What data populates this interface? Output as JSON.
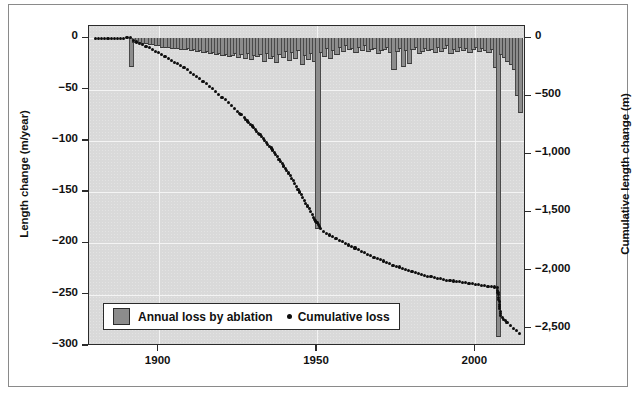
{
  "chart_data": {
    "type": "bar",
    "title": "",
    "subtitle": "",
    "xlabel": "",
    "ylabel": "Length change (m/year)",
    "y2label": "Cumulative length change (m)",
    "xlim": [
      1878,
      2016
    ],
    "ylim": [
      -300,
      12
    ],
    "y2lim": [
      -2650,
      106
    ],
    "grid": true,
    "legend_position": "bottom-left",
    "x_ticks": [
      "1900",
      "1950",
      "2000"
    ],
    "x_tick_values": [
      1900,
      1950,
      2000
    ],
    "y_ticks": [
      "0",
      "−50",
      "−100",
      "−150",
      "−200",
      "−250",
      "−300"
    ],
    "y_tick_values": [
      0,
      -50,
      -100,
      -150,
      -200,
      -250,
      -300
    ],
    "y2_ticks": [
      "0",
      "−500",
      "−1,000",
      "−1,500",
      "−2,000",
      "−2,500"
    ],
    "y2_tick_values": [
      0,
      -500,
      -1000,
      -1500,
      -2000,
      -2500
    ],
    "series": [
      {
        "name": "Annual loss by ablation",
        "type": "bar",
        "axis": "left",
        "color": "#8c8c8c",
        "x": [
          1891,
          1892,
          1893,
          1894,
          1895,
          1896,
          1897,
          1898,
          1899,
          1900,
          1901,
          1902,
          1903,
          1904,
          1905,
          1906,
          1907,
          1908,
          1909,
          1910,
          1911,
          1912,
          1913,
          1914,
          1915,
          1916,
          1917,
          1918,
          1919,
          1920,
          1921,
          1922,
          1923,
          1924,
          1925,
          1926,
          1927,
          1928,
          1929,
          1930,
          1931,
          1932,
          1933,
          1934,
          1935,
          1936,
          1937,
          1938,
          1939,
          1940,
          1941,
          1942,
          1943,
          1944,
          1945,
          1946,
          1947,
          1948,
          1949,
          1950,
          1951,
          1952,
          1953,
          1954,
          1955,
          1956,
          1957,
          1958,
          1959,
          1960,
          1961,
          1962,
          1963,
          1964,
          1965,
          1966,
          1967,
          1968,
          1969,
          1970,
          1971,
          1972,
          1973,
          1974,
          1975,
          1976,
          1977,
          1978,
          1979,
          1980,
          1981,
          1982,
          1983,
          1984,
          1985,
          1986,
          1987,
          1988,
          1989,
          1990,
          1991,
          1992,
          1993,
          1994,
          1995,
          1996,
          1997,
          1998,
          1999,
          2000,
          2001,
          2002,
          2003,
          2004,
          2005,
          2006,
          2007,
          2008,
          2009,
          2010,
          2011,
          2012,
          2013,
          2014
        ],
        "values": [
          -27,
          -4,
          -4,
          -4,
          -5,
          -5,
          -6,
          -6,
          -7,
          -7,
          -8,
          -8,
          -8,
          -9,
          -9,
          -9,
          -10,
          -10,
          -9,
          -11,
          -10,
          -12,
          -11,
          -13,
          -12,
          -14,
          -13,
          -15,
          -14,
          -16,
          -15,
          -17,
          -16,
          -14,
          -18,
          -15,
          -19,
          -14,
          -20,
          -16,
          -17,
          -15,
          -22,
          -14,
          -19,
          -17,
          -23,
          -15,
          -18,
          -12,
          -21,
          -13,
          -19,
          -11,
          -25,
          -16,
          -20,
          -14,
          -22,
          -185,
          -13,
          -17,
          -9,
          -19,
          -11,
          -15,
          -8,
          -12,
          -7,
          -10,
          -9,
          -13,
          -8,
          -11,
          -7,
          -12,
          -10,
          -9,
          -14,
          -11,
          -10,
          -8,
          -13,
          -30,
          -12,
          -9,
          -27,
          -11,
          -24,
          -10,
          -8,
          -14,
          -12,
          -9,
          -11,
          -10,
          -13,
          -8,
          -12,
          -9,
          -7,
          -14,
          -10,
          -12,
          -8,
          -11,
          -9,
          -13,
          -10,
          -8,
          -12,
          -9,
          -11,
          -13,
          -10,
          -28,
          -290,
          -15,
          -18,
          -22,
          -25,
          -30,
          -55,
          -72
        ]
      },
      {
        "name": "Cumulative loss",
        "type": "scatter",
        "axis": "right",
        "color": "#0d0d0d",
        "x": [
          1880,
          1881,
          1882,
          1884,
          1885,
          1886,
          1888,
          1889,
          1890,
          1891,
          1892,
          1893,
          1894,
          1895,
          1896,
          1897,
          1898,
          1899,
          1900,
          1901,
          1902,
          1903,
          1904,
          1905,
          1906,
          1907,
          1908,
          1909,
          1910,
          1911,
          1912,
          1913,
          1914,
          1915,
          1916,
          1917,
          1918,
          1919,
          1920,
          1921,
          1922,
          1923,
          1924,
          1925,
          1926,
          1927,
          1928,
          1929,
          1930,
          1931,
          1932,
          1933,
          1934,
          1935,
          1936,
          1937,
          1938,
          1939,
          1940,
          1941,
          1942,
          1943,
          1944,
          1945,
          1946,
          1947,
          1948,
          1949,
          1950,
          1951,
          1952,
          1953,
          1954,
          1955,
          1956,
          1957,
          1958,
          1959,
          1960,
          1961,
          1962,
          1963,
          1964,
          1965,
          1966,
          1967,
          1968,
          1969,
          1970,
          1971,
          1972,
          1973,
          1974,
          1975,
          1976,
          1977,
          1978,
          1979,
          1980,
          1981,
          1982,
          1983,
          1984,
          1985,
          1986,
          1987,
          1988,
          1989,
          1990,
          1991,
          1992,
          1993,
          1994,
          1995,
          1996,
          1997,
          1998,
          1999,
          2000,
          2001,
          2002,
          2003,
          2004,
          2005,
          2006,
          2007,
          2008,
          2009,
          2010,
          2011,
          2012,
          2013,
          2014
        ],
        "values": [
          0,
          0,
          0,
          0,
          0,
          0,
          0,
          0,
          5,
          5,
          -20,
          -32,
          -44,
          -56,
          -68,
          -80,
          -95,
          -110,
          -124,
          -140,
          -155,
          -170,
          -188,
          -205,
          -220,
          -238,
          -255,
          -272,
          -292,
          -310,
          -330,
          -350,
          -372,
          -392,
          -414,
          -436,
          -458,
          -482,
          -506,
          -530,
          -556,
          -580,
          -604,
          -630,
          -658,
          -684,
          -712,
          -740,
          -770,
          -800,
          -832,
          -862,
          -894,
          -928,
          -962,
          -1000,
          -1040,
          -1080,
          -1120,
          -1160,
          -1205,
          -1252,
          -1300,
          -1348,
          -1396,
          -1444,
          -1492,
          -1540,
          -1590,
          -1640,
          -1660,
          -1678,
          -1694,
          -1710,
          -1724,
          -1738,
          -1752,
          -1766,
          -1780,
          -1794,
          -1806,
          -1820,
          -1834,
          -1848,
          -1860,
          -1872,
          -1884,
          -1896,
          -1908,
          -1918,
          -1930,
          -1942,
          -1954,
          -1962,
          -1970,
          -1980,
          -1990,
          -2000,
          -2008,
          -2016,
          -2024,
          -2032,
          -2040,
          -2048,
          -2054,
          -2060,
          -2066,
          -2072,
          -2078,
          -2082,
          -2086,
          -2090,
          -2094,
          -2098,
          -2102,
          -2106,
          -2110,
          -2114,
          -2118,
          -2122,
          -2126,
          -2130,
          -2134,
          -2138,
          -2142,
          -2150,
          -2390,
          -2420,
          -2448,
          -2472,
          -2496,
          -2518,
          -2540
        ]
      }
    ]
  },
  "legend": {
    "bar_label": "Annual loss by ablation",
    "dot_label": "Cumulative loss"
  },
  "colors": {
    "bar_fill": "#8c8c8c",
    "dot_fill": "#0d0d0d",
    "plot_bg": "#d9d9d9",
    "frame": "#2b2b2b"
  }
}
